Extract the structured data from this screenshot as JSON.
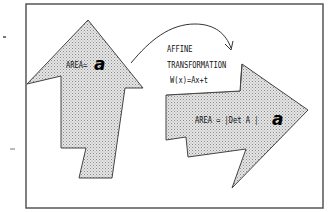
{
  "diagram": {
    "source_shape": {
      "label": "AREA=",
      "symbol": "a",
      "fill": "#d9d9d9",
      "stroke": "#444444"
    },
    "transform_label": {
      "line1": "AFFINE",
      "line2": "TRANSFORMATION",
      "line3": "W(x)=Ax+t"
    },
    "target_shape": {
      "label": "AREA = |Det A |",
      "symbol": "a",
      "fill": "#cfcfcf",
      "stroke": "#444444"
    },
    "colors": {
      "frame": "#555555",
      "background": "#ffffff",
      "dot_pattern": "#888888"
    }
  }
}
